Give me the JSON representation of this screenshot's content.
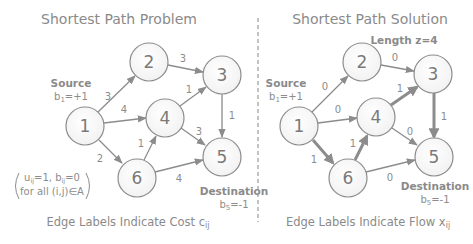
{
  "left_panel": {
    "title": "Shortest Path Problem",
    "source_label": "Source",
    "source_supply_base": "b",
    "source_supply_sub": "1",
    "source_supply_value": "=+1",
    "destination_label": "Destination",
    "destination_supply_base": "b",
    "destination_supply_sub": "5",
    "destination_supply_value": "=-1",
    "note_line1_a": "u",
    "note_line1_sub_a": "ij",
    "note_line1_b": "=1, b",
    "note_line1_sub_b": "ij",
    "note_line1_c": "=0",
    "note_line2": "for all (i,j)∈A",
    "caption_main": "Edge Labels Indicate Cost c",
    "caption_sub": "ij",
    "nodes": [
      {
        "id": "1",
        "label": "1"
      },
      {
        "id": "2",
        "label": "2"
      },
      {
        "id": "3",
        "label": "3"
      },
      {
        "id": "4",
        "label": "4"
      },
      {
        "id": "5",
        "label": "5"
      },
      {
        "id": "6",
        "label": "6"
      }
    ],
    "edges": [
      {
        "from": "1",
        "to": "2",
        "label": "3"
      },
      {
        "from": "1",
        "to": "4",
        "label": "4"
      },
      {
        "from": "1",
        "to": "6",
        "label": "2"
      },
      {
        "from": "2",
        "to": "3",
        "label": "3"
      },
      {
        "from": "4",
        "to": "3",
        "label": "1"
      },
      {
        "from": "3",
        "to": "5",
        "label": "1"
      },
      {
        "from": "4",
        "to": "5",
        "label": "3"
      },
      {
        "from": "6",
        "to": "4",
        "label": "1"
      },
      {
        "from": "6",
        "to": "5",
        "label": "4"
      }
    ]
  },
  "right_panel": {
    "title": "Shortest Path Solution",
    "length_label": "Length z=4",
    "source_label": "Source",
    "source_supply_base": "b",
    "source_supply_sub": "1",
    "source_supply_value": "=+1",
    "destination_label": "Destination",
    "destination_supply_base": "b",
    "destination_supply_sub": "5",
    "destination_supply_value": "=-1",
    "caption_main": "Edge Labels Indicate Flow x",
    "caption_sub": "ij",
    "nodes": [
      {
        "id": "1",
        "label": "1"
      },
      {
        "id": "2",
        "label": "2"
      },
      {
        "id": "3",
        "label": "3"
      },
      {
        "id": "4",
        "label": "4"
      },
      {
        "id": "5",
        "label": "5"
      },
      {
        "id": "6",
        "label": "6"
      }
    ],
    "edges": [
      {
        "from": "1",
        "to": "2",
        "label": "0",
        "in_path": false
      },
      {
        "from": "1",
        "to": "4",
        "label": "0",
        "in_path": false
      },
      {
        "from": "1",
        "to": "6",
        "label": "1",
        "in_path": true
      },
      {
        "from": "2",
        "to": "3",
        "label": "0",
        "in_path": false
      },
      {
        "from": "4",
        "to": "3",
        "label": "1",
        "in_path": true
      },
      {
        "from": "3",
        "to": "5",
        "label": "1",
        "in_path": true
      },
      {
        "from": "4",
        "to": "5",
        "label": "0",
        "in_path": false
      },
      {
        "from": "6",
        "to": "4",
        "label": "1",
        "in_path": true
      },
      {
        "from": "6",
        "to": "5",
        "label": "0",
        "in_path": false
      }
    ]
  },
  "colors": {
    "stroke": "#8c8c8c",
    "text": "#8a8a8a",
    "background": "#ffffff"
  }
}
